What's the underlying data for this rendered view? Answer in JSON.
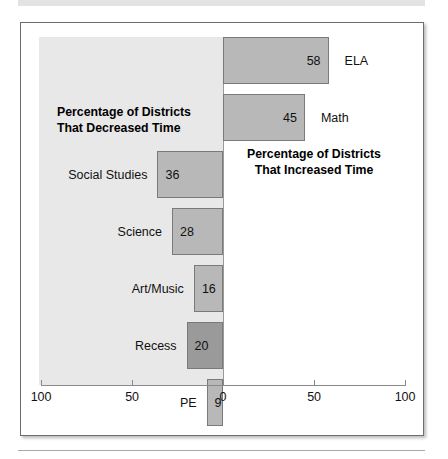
{
  "figure": {
    "frame_border_color": "#6e6e6e",
    "panel_shade_color": "#e8e8e8",
    "bar_fill_color": "#b8b8b8",
    "bar_highlight_color": "#9a9a9a",
    "bar_border_color": "#7a7a7a"
  },
  "annotations": {
    "decreased": "Percentage of Districts\nThat Decreased Time",
    "increased": "Percentage of Districts\nThat Increased Time"
  },
  "axis": {
    "ticks": [
      {
        "label": "100",
        "value": -100
      },
      {
        "label": "50",
        "value": -50
      },
      {
        "label": "0",
        "value": 0
      },
      {
        "label": "50",
        "value": 50
      },
      {
        "label": "100",
        "value": 100
      }
    ]
  },
  "chart_data": {
    "type": "bar",
    "orientation": "horizontal",
    "diverging": true,
    "title": "",
    "subtitle": "",
    "xlabel": "",
    "ylabel": "",
    "xlim": [
      -100,
      100
    ],
    "grid": false,
    "legend": null,
    "annotations": [
      "Percentage of Districts That Decreased Time",
      "Percentage of Districts That Increased Time"
    ],
    "axis_tick_labels": [
      "100",
      "50",
      "0",
      "50",
      "100"
    ],
    "categories": [
      "ELA",
      "Math",
      "Social Studies",
      "Science",
      "Art/Music",
      "Recess",
      "PE"
    ],
    "values": [
      58,
      45,
      -36,
      -28,
      -16,
      -20,
      -9
    ],
    "data_labels": [
      "58",
      "45",
      "36",
      "28",
      "16",
      "20",
      "9"
    ],
    "series": [
      {
        "name": "Percentage of Districts",
        "values": [
          58,
          45,
          -36,
          -28,
          -16,
          -20,
          -9
        ]
      }
    ],
    "bars": [
      {
        "category": "ELA",
        "value": 58,
        "label": "58",
        "direction": "increase",
        "label_side": "right",
        "highlight": false
      },
      {
        "category": "Math",
        "value": 45,
        "label": "45",
        "direction": "increase",
        "label_side": "right",
        "highlight": false
      },
      {
        "category": "Social Studies",
        "value": -36,
        "label": "36",
        "direction": "decrease",
        "label_side": "left",
        "highlight": false
      },
      {
        "category": "Science",
        "value": -28,
        "label": "28",
        "direction": "decrease",
        "label_side": "left",
        "highlight": false
      },
      {
        "category": "Art/Music",
        "value": -16,
        "label": "16",
        "direction": "decrease",
        "label_side": "left",
        "highlight": false
      },
      {
        "category": "Recess",
        "value": -20,
        "label": "20",
        "direction": "decrease",
        "label_side": "left",
        "highlight": true
      },
      {
        "category": "PE",
        "value": -9,
        "label": "9",
        "direction": "decrease",
        "label_side": "left",
        "highlight": false
      }
    ]
  }
}
